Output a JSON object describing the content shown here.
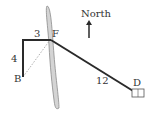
{
  "diagram": {
    "labels": {
      "north": "North",
      "point_f": "F",
      "point_b": "B",
      "point_d": "D",
      "segment_top": "3",
      "segment_left": "4",
      "segment_long": "12"
    },
    "colors": {
      "path": "#2a2a2a",
      "river_fill": "#d4d4d4",
      "river_stroke": "#8a8a8a",
      "dashed": "#9a9a9a",
      "text": "#333333"
    }
  }
}
